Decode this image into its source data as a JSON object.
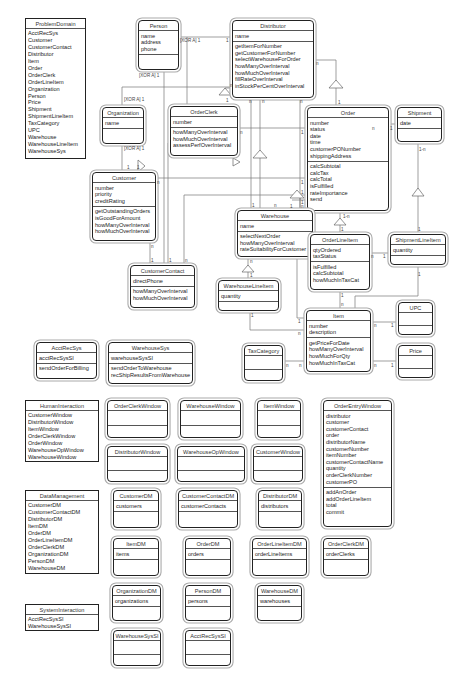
{
  "diagram": {
    "title": "",
    "packages": [
      {
        "id": "problemDomain",
        "name": "ProblemDomain",
        "items": [
          "AcctRecSys",
          "Customer",
          "CustomerContact",
          "Distributor",
          "Item",
          "Order",
          "OrderClerk",
          "OrderLineItem",
          "Organization",
          "Person",
          "Price",
          "Shipment",
          "ShipmentLineItem",
          "TaxCategory",
          "UPC",
          "Warehouse",
          "WarehouseLineItem",
          "WarehouseSys"
        ]
      },
      {
        "id": "humanInteraction",
        "name": "HumanInteraction",
        "items": [
          "CustomerWindow",
          "DistributorWindow",
          "ItemWindow",
          "OrderClerkWindow",
          "OrderWindow",
          "WarehouseOpWindow",
          "WarehouseWindow"
        ]
      },
      {
        "id": "dataManagement",
        "name": "DataManagement",
        "items": [
          "CustomerDM",
          "CustomerContactDM",
          "DistributorDM",
          "ItemDM",
          "OrderDM",
          "OrderLineItemDM",
          "OrderClerkDM",
          "OrganizationDM",
          "PersonDM",
          "WarehouseDM"
        ]
      },
      {
        "id": "systemInteraction",
        "name": "SystemInteraction",
        "items": [
          "AcctRecSysSI",
          "WarehouseSysSI"
        ]
      }
    ],
    "classes": {
      "person": {
        "name": "Person",
        "attributes": [
          "name",
          "address",
          "phone"
        ],
        "services": []
      },
      "distributor": {
        "name": "Distributor",
        "attributes": [
          "name"
        ],
        "services": [
          "getItemForNumber",
          "getCustomerForNumber",
          "selectWarehouseForOrder",
          "howManyOverInterval",
          "howMuchOverInterval",
          "fillRateOverInterval",
          "inStockPerCentOverInterval"
        ]
      },
      "organization": {
        "name": "Organization",
        "attributes": [
          "name"
        ],
        "services": []
      },
      "orderClerk": {
        "name": "OrderClerk",
        "attributes": [
          "number"
        ],
        "services": [
          "howManyOverInterval",
          "howMuchOverInterval",
          "assessPerfOverInterval"
        ]
      },
      "order": {
        "name": "Order",
        "attributes": [
          "number",
          "status",
          "date",
          "time",
          "customerPONumber",
          "shippingAddress"
        ],
        "services": [
          "calcSubtotal",
          "calcTax",
          "calcTotal",
          "isFulfilled",
          "rateImportance",
          "send"
        ]
      },
      "shipment": {
        "name": "Shipment",
        "attributes": [
          "date"
        ],
        "services": []
      },
      "customer": {
        "name": "Customer",
        "attributes": [
          "number",
          "priority",
          "creditRating"
        ],
        "services": [
          "getOutstandingOrders",
          "isGoodForAmount",
          "howManyOverInterval",
          "howMuchOverInterval"
        ]
      },
      "warehouse": {
        "name": "Warehouse",
        "attributes": [
          "name"
        ],
        "services": [
          "selectNextOrder",
          "howManyOverInterval",
          "rateSuitabilityForCustomer"
        ]
      },
      "orderLineItem": {
        "name": "OrderLineItem",
        "attributes": [
          "qtyOrdered",
          "taxStatus"
        ],
        "services": [
          "isFulfilled",
          "calcSubtotal",
          "howMuchInTaxCat"
        ]
      },
      "shipmentLineItem": {
        "name": "ShipmentLineItem",
        "attributes": [
          "quantity"
        ],
        "services": []
      },
      "customerContact": {
        "name": "CustomerContact",
        "attributes": [
          "directPhone"
        ],
        "services": [
          "howManyOverInterval",
          "howMuchOverInterval"
        ]
      },
      "warehouseLineItem": {
        "name": "WarehouseLineItem",
        "attributes": [
          "quantity"
        ],
        "services": []
      },
      "item": {
        "name": "Item",
        "attributes": [
          "number",
          "description"
        ],
        "services": [
          "getPriceForDate",
          "howManyOverInterval",
          "howMuchForQty",
          "howMuchInTaxCat"
        ]
      },
      "upc": {
        "name": "UPC",
        "attributes": [],
        "services": []
      },
      "price": {
        "name": "Price",
        "attributes": [],
        "services": []
      },
      "acctRecSys": {
        "name": "AcctRecSys",
        "attributes": [
          "acctRecSysSI"
        ],
        "services": [
          "sendOrderForBilling"
        ]
      },
      "warehouseSys": {
        "name": "WarehouseSys",
        "attributes": [
          "warehouseSysSI"
        ],
        "services": [
          "sendOrderToWarehouse",
          "recShipResultsFromWarehouse"
        ]
      },
      "taxCategory": {
        "name": "TaxCategory",
        "attributes": [],
        "services": []
      },
      "orderClerkWindow": {
        "name": "OrderClerkWindow",
        "attributes": [],
        "services": []
      },
      "warehouseWindow": {
        "name": "WarehouseWindow",
        "attributes": [],
        "services": []
      },
      "itemWindow": {
        "name": "ItemWindow",
        "attributes": [],
        "services": []
      },
      "distributorWindow": {
        "name": "DistributorWindow",
        "attributes": [],
        "services": []
      },
      "warehouseOpWindow": {
        "name": "WarehouseOpWindow",
        "attributes": [],
        "services": []
      },
      "customerWindow": {
        "name": "CustomerWindow",
        "attributes": [],
        "services": []
      },
      "orderEntryWindow": {
        "name": "OrderEntryWindow",
        "attributes": [
          "distributor",
          "customer",
          "customerContact",
          "order",
          "distributorName",
          "customerNumber",
          "itemNumber",
          "customerContactName",
          "quantity",
          "orderClerkNumber",
          "customerPO"
        ],
        "services": [
          "addAnOrder",
          "addOrderLineItem",
          "total",
          "commit"
        ]
      },
      "customerDM": {
        "name": "CustomerDM",
        "attributes": [
          "customers"
        ],
        "services": []
      },
      "customerContactDM": {
        "name": "CustomerContactDM",
        "attributes": [
          "customerContacts"
        ],
        "services": []
      },
      "distributorDM": {
        "name": "DistributorDM",
        "attributes": [
          "distributors"
        ],
        "services": []
      },
      "itemDM": {
        "name": "ItemDM",
        "attributes": [
          "items"
        ],
        "services": []
      },
      "orderDM": {
        "name": "OrderDM",
        "attributes": [
          "orders"
        ],
        "services": []
      },
      "orderLineItemDM": {
        "name": "OrderLineItemDM",
        "attributes": [
          "orderLineItems"
        ],
        "services": []
      },
      "orderClerkDM": {
        "name": "OrderClerkDM",
        "attributes": [
          "orderClerks"
        ],
        "services": []
      },
      "organizationDM": {
        "name": "OrganizationDM",
        "attributes": [
          "organizations"
        ],
        "services": []
      },
      "personDM": {
        "name": "PersonDM",
        "attributes": [
          "persons"
        ],
        "services": []
      },
      "warehouseDM": {
        "name": "WarehouseDM",
        "attributes": [
          "warehouses"
        ],
        "services": []
      },
      "warehouseSysSI": {
        "name": "WarehouseSysSI",
        "attributes": [],
        "services": []
      },
      "acctRecSysSI": {
        "name": "AcctRecSysSI",
        "attributes": [],
        "services": []
      }
    },
    "labels": {
      "xorA1": "[XOR A] 1",
      "one": "1",
      "n": "n",
      "oneToN": "1-n"
    }
  }
}
